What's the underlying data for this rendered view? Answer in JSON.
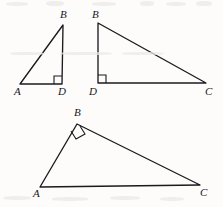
{
  "figure": {
    "background_color": "#fdfcfb",
    "stroke_color": "#1b1b1f",
    "width": 223,
    "height": 207,
    "triangles": [
      {
        "id": "triangle-abd-left",
        "name": "Triangle ABD (tall narrow, top-left)",
        "vertices": [
          {
            "label": "A",
            "x": 20,
            "y": 84,
            "label_x": 14,
            "label_y": 86
          },
          {
            "label": "B",
            "x": 63,
            "y": 25,
            "label_x": 60,
            "label_y": 9
          },
          {
            "label": "D",
            "x": 62,
            "y": 84,
            "label_x": 58,
            "label_y": 86
          }
        ],
        "edges": [
          {
            "from": "A",
            "to": "B"
          },
          {
            "from": "B",
            "to": "D"
          },
          {
            "from": "D",
            "to": "A"
          }
        ],
        "right_angle_at": "D",
        "right_angle_mark": {
          "x": 53,
          "y": 75,
          "size": 8,
          "rotation": 0
        }
      },
      {
        "id": "triangle-bdc-right",
        "name": "Triangle BDC (wide, top-right)",
        "vertices": [
          {
            "label": "B",
            "x": 98,
            "y": 23,
            "label_x": 92,
            "label_y": 9
          },
          {
            "label": "D",
            "x": 98,
            "y": 83,
            "label_x": 89,
            "label_y": 86
          },
          {
            "label": "C",
            "x": 206,
            "y": 83,
            "label_x": 205,
            "label_y": 86
          }
        ],
        "edges": [
          {
            "from": "B",
            "to": "D"
          },
          {
            "from": "D",
            "to": "C"
          },
          {
            "from": "C",
            "to": "B"
          }
        ],
        "right_angle_at": "D",
        "right_angle_mark": {
          "x": 98,
          "y": 75,
          "size": 8,
          "rotation": 0
        }
      },
      {
        "id": "triangle-abc-bottom",
        "name": "Triangle ABC (bottom, right angle at B)",
        "vertices": [
          {
            "label": "A",
            "x": 40,
            "y": 187,
            "label_x": 33,
            "label_y": 188
          },
          {
            "label": "B",
            "x": 77,
            "y": 124,
            "label_x": 74,
            "label_y": 107
          },
          {
            "label": "C",
            "x": 200,
            "y": 185,
            "label_x": 200,
            "label_y": 187
          }
        ],
        "edges": [
          {
            "from": "A",
            "to": "B"
          },
          {
            "from": "B",
            "to": "C"
          },
          {
            "from": "C",
            "to": "A"
          }
        ],
        "right_angle_at": "B",
        "right_angle_mark": {
          "x": 77,
          "y": 124,
          "size": 9,
          "rotation": 30
        }
      }
    ],
    "scan_artifacts": [
      {
        "x": 6,
        "y": 2,
        "w": 22,
        "h": 4
      },
      {
        "x": 46,
        "y": 1,
        "w": 18,
        "h": 5
      },
      {
        "x": 92,
        "y": 2,
        "w": 24,
        "h": 4
      },
      {
        "x": 140,
        "y": 1,
        "w": 14,
        "h": 5
      },
      {
        "x": 166,
        "y": 2,
        "w": 20,
        "h": 4
      },
      {
        "x": 196,
        "y": 1,
        "w": 16,
        "h": 5
      },
      {
        "x": 10,
        "y": 52,
        "w": 34,
        "h": 3
      },
      {
        "x": 60,
        "y": 52,
        "w": 52,
        "h": 3
      },
      {
        "x": 122,
        "y": 52,
        "w": 42,
        "h": 3
      },
      {
        "x": 3,
        "y": 196,
        "w": 28,
        "h": 4
      },
      {
        "x": 52,
        "y": 197,
        "w": 36,
        "h": 4
      },
      {
        "x": 110,
        "y": 196,
        "w": 30,
        "h": 4
      },
      {
        "x": 160,
        "y": 197,
        "w": 24,
        "h": 4
      }
    ]
  }
}
